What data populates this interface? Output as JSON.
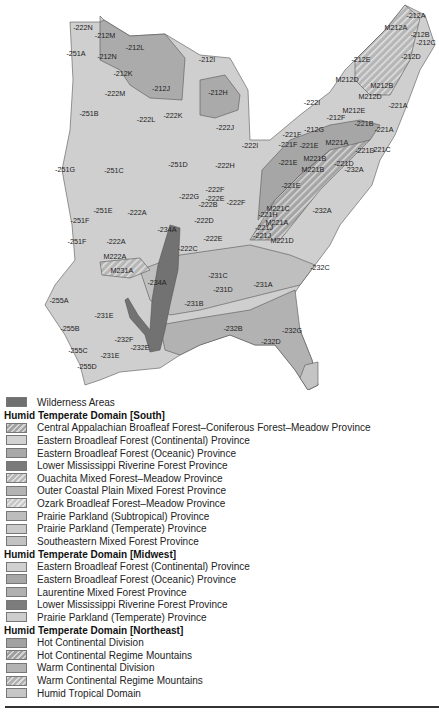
{
  "map": {
    "region_labels": [
      {
        "text": "-222N",
        "x": 83,
        "y": 30
      },
      {
        "text": "-212M",
        "x": 105,
        "y": 38
      },
      {
        "text": "-212L",
        "x": 135,
        "y": 50
      },
      {
        "text": "-251A",
        "x": 76,
        "y": 56
      },
      {
        "text": "-212N",
        "x": 107,
        "y": 59
      },
      {
        "text": "-212I",
        "x": 207,
        "y": 62
      },
      {
        "text": "-212K",
        "x": 123,
        "y": 76
      },
      {
        "text": "-212J",
        "x": 161,
        "y": 91
      },
      {
        "text": "-212H",
        "x": 218,
        "y": 95
      },
      {
        "text": "-222M",
        "x": 115,
        "y": 96
      },
      {
        "text": "-251B",
        "x": 89,
        "y": 116
      },
      {
        "text": "-222L",
        "x": 146,
        "y": 122
      },
      {
        "text": "-222K",
        "x": 173,
        "y": 118
      },
      {
        "text": "-222J",
        "x": 225,
        "y": 130
      },
      {
        "text": "-251D",
        "x": 178,
        "y": 167
      },
      {
        "text": "-251C",
        "x": 114,
        "y": 173
      },
      {
        "text": "-222H",
        "x": 225,
        "y": 168
      },
      {
        "text": "-251G",
        "x": 65,
        "y": 172
      },
      {
        "text": "-222I",
        "x": 250,
        "y": 148
      },
      {
        "text": "-222G",
        "x": 189,
        "y": 199
      },
      {
        "text": "-222F",
        "x": 215,
        "y": 192
      },
      {
        "text": "-222E",
        "x": 215,
        "y": 201
      },
      {
        "text": "-222B",
        "x": 208,
        "y": 207
      },
      {
        "text": "-222F",
        "x": 236,
        "y": 205
      },
      {
        "text": "-222D",
        "x": 204,
        "y": 223
      },
      {
        "text": "-251E",
        "x": 103,
        "y": 213
      },
      {
        "text": "-222A",
        "x": 137,
        "y": 215
      },
      {
        "text": "-251F",
        "x": 80,
        "y": 223
      },
      {
        "text": "-222E",
        "x": 213,
        "y": 241
      },
      {
        "text": "-222C",
        "x": 188,
        "y": 251
      },
      {
        "text": "-251F",
        "x": 77,
        "y": 244
      },
      {
        "text": "-222A",
        "x": 116,
        "y": 244
      },
      {
        "text": "M222A",
        "x": 115,
        "y": 259
      },
      {
        "text": "-234A",
        "x": 167,
        "y": 232
      },
      {
        "text": "M231A",
        "x": 122,
        "y": 273
      },
      {
        "text": "-234A",
        "x": 157,
        "y": 285
      },
      {
        "text": "-255A",
        "x": 59,
        "y": 303
      },
      {
        "text": "-231B",
        "x": 194,
        "y": 306
      },
      {
        "text": "-231C",
        "x": 218,
        "y": 278
      },
      {
        "text": "-231D",
        "x": 223,
        "y": 292
      },
      {
        "text": "-231A",
        "x": 263,
        "y": 287
      },
      {
        "text": "-231E",
        "x": 104,
        "y": 318
      },
      {
        "text": "-255B",
        "x": 70,
        "y": 331
      },
      {
        "text": "-232F",
        "x": 124,
        "y": 342
      },
      {
        "text": "-232E",
        "x": 140,
        "y": 350
      },
      {
        "text": "-232B",
        "x": 233,
        "y": 331
      },
      {
        "text": "-255C",
        "x": 78,
        "y": 353
      },
      {
        "text": "-231E",
        "x": 110,
        "y": 358
      },
      {
        "text": "-255D",
        "x": 87,
        "y": 369
      },
      {
        "text": "-232D",
        "x": 271,
        "y": 344
      },
      {
        "text": "-232G",
        "x": 292,
        "y": 333
      },
      {
        "text": "-232C",
        "x": 320,
        "y": 270
      },
      {
        "text": "-232A",
        "x": 322,
        "y": 213
      },
      {
        "text": "-411A",
        "x": 325,
        "y": 404
      },
      {
        "text": "-212A",
        "x": 416,
        "y": 18
      },
      {
        "text": "M212A",
        "x": 396,
        "y": 30
      },
      {
        "text": "-212B",
        "x": 420,
        "y": 37
      },
      {
        "text": "-212C",
        "x": 426,
        "y": 45
      },
      {
        "text": "-212D",
        "x": 411,
        "y": 59
      },
      {
        "text": "-212E",
        "x": 361,
        "y": 62
      },
      {
        "text": "M212D",
        "x": 347,
        "y": 82
      },
      {
        "text": "M212B",
        "x": 382,
        "y": 88
      },
      {
        "text": "M212D",
        "x": 370,
        "y": 99
      },
      {
        "text": "-222I",
        "x": 312,
        "y": 105
      },
      {
        "text": "M212E",
        "x": 354,
        "y": 113
      },
      {
        "text": "-221A",
        "x": 398,
        "y": 108
      },
      {
        "text": "-212F",
        "x": 336,
        "y": 120
      },
      {
        "text": "-221B",
        "x": 364,
        "y": 126
      },
      {
        "text": "-221A",
        "x": 384,
        "y": 132
      },
      {
        "text": "-212G",
        "x": 314,
        "y": 132
      },
      {
        "text": "-221F",
        "x": 292,
        "y": 137
      },
      {
        "text": "-221F",
        "x": 288,
        "y": 147
      },
      {
        "text": "-221E",
        "x": 309,
        "y": 148
      },
      {
        "text": "M221A",
        "x": 337,
        "y": 145
      },
      {
        "text": "-221D",
        "x": 365,
        "y": 153
      },
      {
        "text": "-221C",
        "x": 381,
        "y": 152
      },
      {
        "text": "M221B",
        "x": 315,
        "y": 161
      },
      {
        "text": "-221E",
        "x": 288,
        "y": 165
      },
      {
        "text": "M221B",
        "x": 313,
        "y": 172
      },
      {
        "text": "-221D",
        "x": 344,
        "y": 166
      },
      {
        "text": "-232A",
        "x": 354,
        "y": 172
      },
      {
        "text": "-221E",
        "x": 291,
        "y": 188
      },
      {
        "text": "M221C",
        "x": 278,
        "y": 211
      },
      {
        "text": "-221H",
        "x": 268,
        "y": 217
      },
      {
        "text": "M221A",
        "x": 277,
        "y": 225
      },
      {
        "text": "-221J",
        "x": 264,
        "y": 230
      },
      {
        "text": "-221J",
        "x": 262,
        "y": 238
      },
      {
        "text": "M221D",
        "x": 282,
        "y": 243
      }
    ]
  },
  "legend": {
    "wilderness": {
      "label": "Wilderness Areas",
      "color": "#6f6f6f"
    },
    "groups": [
      {
        "title": "Humid Temperate Domain [South]",
        "items": [
          {
            "label": "Central Appalachian Broafleaf Forest–Coniferous Forest–Meadow Province",
            "color": "#a3a3a3",
            "hatched": true
          },
          {
            "label": "Eastern Broadleaf Forest (Continental) Province",
            "color": "#d2d2d2",
            "hatched": false
          },
          {
            "label": "Eastern Broadleaf Forest (Oceanic) Province",
            "color": "#a9a9a9",
            "hatched": false
          },
          {
            "label": "Lower Mississippi Riverine Forest Province",
            "color": "#7a7a7a",
            "hatched": false
          },
          {
            "label": "Ouachita Mixed Forest–Meadow Province",
            "color": "#b8b8b8",
            "hatched": true
          },
          {
            "label": "Outer Coastal Plain Mixed Forest Province",
            "color": "#b4b4b4",
            "hatched": false
          },
          {
            "label": "Ozark Broadleaf Forest–Meadow Province",
            "color": "#c8c8c8",
            "hatched": true
          },
          {
            "label": "Prairie Parkland (Subtropical) Province",
            "color": "#bdbdbd",
            "hatched": false
          },
          {
            "label": "Prairie Parkland (Temperate) Province",
            "color": "#cbcbcb",
            "hatched": false
          },
          {
            "label": "Southeastern Mixed Forest Province",
            "color": "#c2c2c2",
            "hatched": false
          }
        ]
      },
      {
        "title": "Humid Temperate Domain [Midwest]",
        "items": [
          {
            "label": "Eastern Broadleaf Forest (Continental) Province",
            "color": "#d0d0d0",
            "hatched": false
          },
          {
            "label": "Eastern Broadleaf Forest (Oceanic) Province",
            "color": "#a7a7a7",
            "hatched": false
          },
          {
            "label": "Laurentine Mixed Forest Province",
            "color": "#b0b0b0",
            "hatched": false
          },
          {
            "label": "Lower Mississippi Riverine Forest Province",
            "color": "#7c7c7c",
            "hatched": false
          },
          {
            "label": "Prairie Parkland (Temperate) Province",
            "color": "#cdcdcd",
            "hatched": false
          }
        ]
      },
      {
        "title": "Humid Temperate Domain [Northeast]",
        "items": [
          {
            "label": "Hot Continental Division",
            "color": "#a2a2a2",
            "hatched": false
          },
          {
            "label": "Hot Continental Regime Mountains",
            "color": "#a0a0a0",
            "hatched": true
          },
          {
            "label": "Warm Continental Division",
            "color": "#b3b3b3",
            "hatched": false
          },
          {
            "label": "Warm Continental Regime Mountains",
            "color": "#b0b0b0",
            "hatched": true
          },
          {
            "label": "Humid Tropical Domain",
            "color": "#c6c6c6",
            "hatched": false
          }
        ]
      }
    ]
  }
}
